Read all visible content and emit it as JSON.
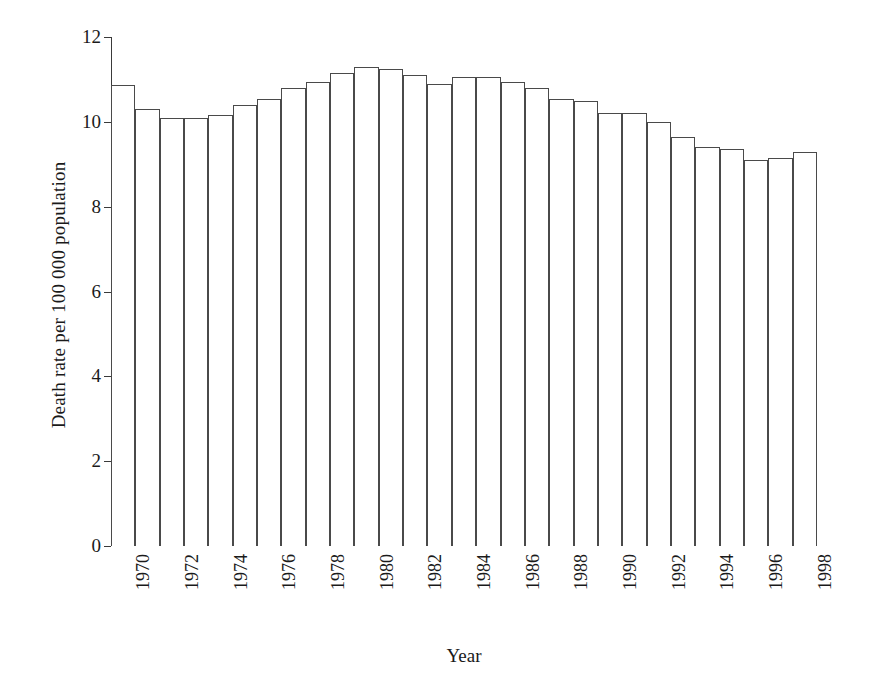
{
  "chart_data": {
    "type": "bar",
    "title": "",
    "xlabel": "Year",
    "ylabel": "Death rate per 100 000 population",
    "ylim": [
      0,
      12
    ],
    "yticks": [
      0,
      2,
      4,
      6,
      8,
      10,
      12
    ],
    "grid": false,
    "legend": null,
    "categories": [
      "1970",
      "1971",
      "1972",
      "1973",
      "1974",
      "1975",
      "1976",
      "1977",
      "1978",
      "1979",
      "1980",
      "1981",
      "1982",
      "1983",
      "1984",
      "1985",
      "1986",
      "1987",
      "1988",
      "1989",
      "1990",
      "1991",
      "1992",
      "1993",
      "1994",
      "1995",
      "1996",
      "1997",
      "1998"
    ],
    "values": [
      10.87,
      10.3,
      10.1,
      10.1,
      10.15,
      10.4,
      10.55,
      10.8,
      10.95,
      11.15,
      11.3,
      11.25,
      11.1,
      10.9,
      11.05,
      11.05,
      10.95,
      10.8,
      10.55,
      10.5,
      10.2,
      10.2,
      10.0,
      9.65,
      9.4,
      9.35,
      9.1,
      9.15,
      9.3
    ],
    "visible_tick_labels": [
      "1970",
      "1972",
      "1974",
      "1976",
      "1978",
      "1980",
      "1982",
      "1984",
      "1986",
      "1988",
      "1990",
      "1992",
      "1994",
      "1996",
      "1998"
    ],
    "bar_style": {
      "fill": "#ffffff",
      "edge": "#4a4a4a"
    },
    "axis_color": "#3a3a3a"
  }
}
